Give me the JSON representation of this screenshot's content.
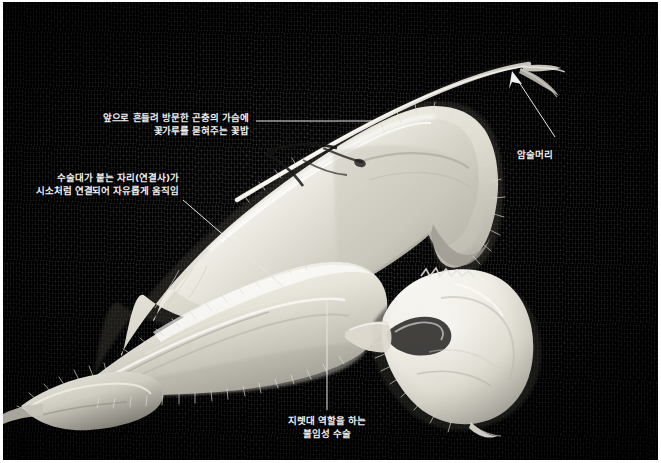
{
  "figure": {
    "kind": "photograph",
    "width": 661,
    "height": 463,
    "background_color": "#121212",
    "plate_border_color": "#ffffff",
    "specimen_color": "#e8e6df",
    "annotation_text_color": "#f2f2f2",
    "leader_line_color": "#e6e6e6"
  },
  "annotations": [
    {
      "id": "anther-callout",
      "name": "anther-label",
      "text_lines": [
        "앞으로 흔들려 방문한 곤충의 가슴에",
        "꽃가루를 묻혀주는 꽃밥"
      ],
      "text": "앞으로 흔들려 방문한 곤충의 가슴에\n꽃가루를 묻혀주는 꽃밥",
      "align": "right",
      "text_x": 95,
      "text_y": 110,
      "leader": {
        "type": "line",
        "x1": 256,
        "y1": 121,
        "x2": 372,
        "y2": 121
      }
    },
    {
      "id": "connective-callout",
      "name": "connective-lever-label",
      "text_lines": [
        "수술대가 붙는 자리(연결사)가",
        "시소처럼 연결되어 자유롭게 움직임"
      ],
      "text": "수술대가 붙는 자리(연결사)가\n시소처럼 연결되어 자유롭게 움직임",
      "align": "right",
      "text_x": 62,
      "text_y": 170,
      "leader": {
        "type": "line",
        "x1": 183,
        "y1": 200,
        "x2": 293,
        "y2": 295
      }
    },
    {
      "id": "stigma-callout",
      "name": "stigma-label",
      "text_lines": [
        "암술머리"
      ],
      "text": "암술머리",
      "align": "left",
      "text_x": 516,
      "text_y": 145,
      "leader": {
        "type": "arrow",
        "x1": 555,
        "y1": 137,
        "x2": 512,
        "y2": 73
      }
    },
    {
      "id": "staminode-callout",
      "name": "sterile-stamen-lever-label",
      "text_lines": [
        "지렛대 역할을 하는",
        "불임성 수술"
      ],
      "text": "지렛대 역할을 하는\n불임성 수술",
      "align": "center",
      "text_x": 272,
      "text_y": 415,
      "leader": {
        "type": "line",
        "x1": 327,
        "y1": 410,
        "x2": 327,
        "y2": 300
      }
    }
  ]
}
